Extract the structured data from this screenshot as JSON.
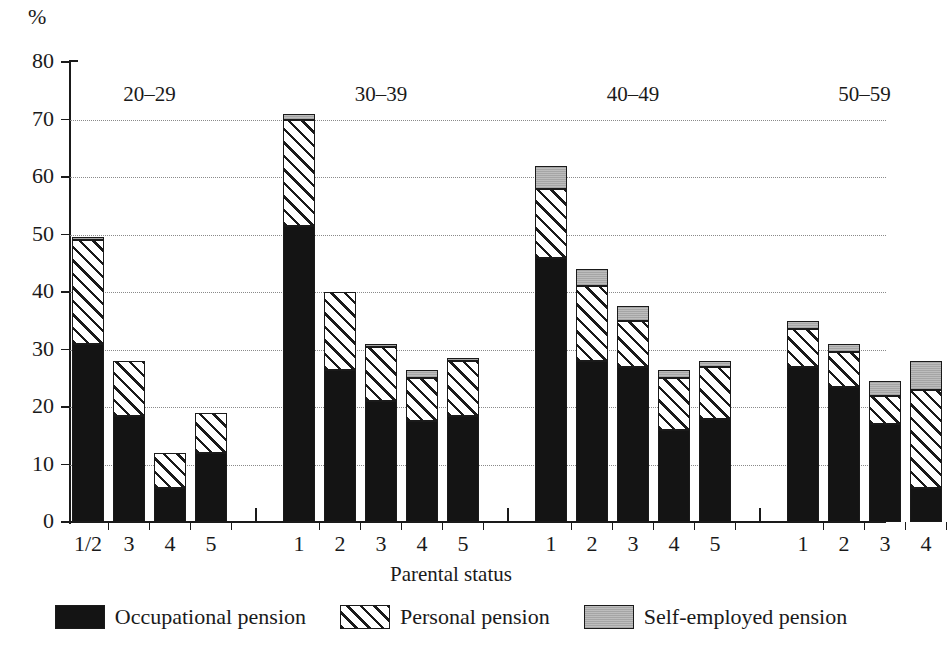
{
  "axis": {
    "y_unit_label": "%",
    "x_title": "Parental status",
    "y_ticks": [
      "0",
      "10",
      "20",
      "30",
      "40",
      "50",
      "60",
      "70",
      "80"
    ]
  },
  "legend": {
    "items": [
      {
        "key": "occupational",
        "label": "Occupational pension",
        "swatch": "black-solid",
        "color": "#141414"
      },
      {
        "key": "personal",
        "label": "Personal pension",
        "swatch": "diagonal-hatch",
        "color": "#ffffff"
      },
      {
        "key": "self_employed",
        "label": "Self-employed pension",
        "swatch": "grey-solid",
        "color": "#c9c9c9"
      }
    ]
  },
  "groups": [
    {
      "header": "20–29",
      "labels": [
        "1/2",
        "3",
        "4",
        "5"
      ]
    },
    {
      "header": "30–39",
      "labels": [
        "1",
        "2",
        "3",
        "4",
        "5"
      ]
    },
    {
      "header": "40–49",
      "labels": [
        "1",
        "2",
        "3",
        "4",
        "5"
      ]
    },
    {
      "header": "50–59",
      "labels": [
        "1",
        "2",
        "3",
        "4"
      ]
    }
  ],
  "chart_data": {
    "type": "bar",
    "stacked": true,
    "title": "",
    "xlabel": "Parental status",
    "ylabel": "%",
    "ylim": [
      0,
      80
    ],
    "ytick_step": 10,
    "grid": "horizontal-dotted",
    "legend_position": "bottom-center",
    "group_label": "Age group",
    "categories": [
      "20-29 / 1/2",
      "20-29 / 3",
      "20-29 / 4",
      "20-29 / 5",
      "30-39 / 1",
      "30-39 / 2",
      "30-39 / 3",
      "30-39 / 4",
      "30-39 / 5",
      "40-49 / 1",
      "40-49 / 2",
      "40-49 / 3",
      "40-49 / 4",
      "40-49 / 5",
      "50-59 / 1",
      "50-59 / 2",
      "50-59 / 3",
      "50-59 / 4"
    ],
    "series": [
      {
        "name": "Occupational pension",
        "values": [
          31,
          18.5,
          6,
          12,
          51.5,
          26.5,
          21,
          17.5,
          18.5,
          46,
          28,
          27,
          16,
          18,
          27,
          23.5,
          17,
          6
        ]
      },
      {
        "name": "Personal pension",
        "values": [
          18,
          9.5,
          6,
          7,
          18.5,
          13.5,
          9.5,
          7.5,
          9.5,
          12,
          13,
          8,
          9,
          9,
          6.5,
          6,
          5,
          17
        ]
      },
      {
        "name": "Self-employed pension",
        "values": [
          0.5,
          0,
          0,
          0,
          1,
          0,
          0.5,
          1.5,
          0.5,
          4,
          3,
          2.5,
          1.5,
          1,
          1.5,
          1.5,
          2.5,
          5
        ]
      }
    ],
    "totals": [
      49.5,
      28,
      12,
      19,
      71,
      40,
      30.5,
      26.5,
      28.5,
      62,
      44,
      37.5,
      26.5,
      28,
      35,
      31,
      24.5,
      28
    ]
  }
}
